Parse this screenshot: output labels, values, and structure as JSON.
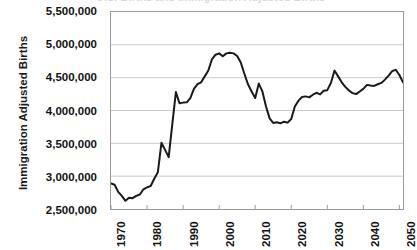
{
  "title_clipped": "U.S. Births and Immigration Adjusted Births",
  "axes": {
    "y_title": "Immigration Adjusted Births",
    "y_ticks": [
      "5,500,000",
      "5,000,000",
      "4,500,000",
      "4,000,000",
      "3,500,000",
      "3,000,000",
      "2,500,000"
    ],
    "x_ticks": [
      "1970",
      "1980",
      "1990",
      "2000",
      "2010",
      "2020",
      "2030",
      "2040",
      "2050"
    ]
  },
  "colors": {
    "series_line": "#1a1a1a",
    "gridline": "#c9c9c9",
    "frame": "#9a9a9a",
    "text": "#111111",
    "background": "#ffffff"
  },
  "chart_data": {
    "type": "line",
    "title": "",
    "xlabel": "",
    "ylabel": "Immigration Adjusted Births",
    "xlim": [
      1970,
      2051
    ],
    "ylim": [
      2500000,
      5500000
    ],
    "ytick_step": 500000,
    "xtick_step": 10,
    "grid": "horizontal",
    "legend": "none",
    "series": [
      {
        "name": "Immigration Adjusted Births",
        "color": "#1a1a1a",
        "x": [
          1970,
          1971,
          1972,
          1973,
          1974,
          1975,
          1976,
          1977,
          1978,
          1979,
          1980,
          1981,
          1982,
          1983,
          1984,
          1985,
          1986,
          1987,
          1988,
          1989,
          1990,
          1991,
          1992,
          1993,
          1994,
          1995,
          1996,
          1997,
          1998,
          1999,
          2000,
          2001,
          2002,
          2003,
          2004,
          2005,
          2006,
          2007,
          2008,
          2009,
          2010,
          2011,
          2012,
          2013,
          2014,
          2015,
          2016,
          2017,
          2018,
          2019,
          2020,
          2021,
          2022,
          2023,
          2024,
          2025,
          2026,
          2027,
          2028,
          2029,
          2030,
          2031,
          2032,
          2033,
          2034,
          2035,
          2036,
          2037,
          2038,
          2039,
          2040,
          2041,
          2042,
          2043,
          2044,
          2045,
          2046,
          2047,
          2048,
          2049,
          2050,
          2051
        ],
        "values": [
          2890000,
          2870000,
          2760000,
          2700000,
          2625000,
          2670000,
          2665000,
          2700000,
          2720000,
          2800000,
          2830000,
          2850000,
          2960000,
          3060000,
          3510000,
          3400000,
          3290000,
          3790000,
          4280000,
          4110000,
          4120000,
          4125000,
          4190000,
          4330000,
          4400000,
          4430000,
          4520000,
          4610000,
          4780000,
          4850000,
          4870000,
          4825000,
          4870000,
          4880000,
          4870000,
          4830000,
          4730000,
          4560000,
          4400000,
          4290000,
          4190000,
          4410000,
          4290000,
          4060000,
          3880000,
          3810000,
          3820000,
          3805000,
          3830000,
          3815000,
          3870000,
          4060000,
          4150000,
          4205000,
          4215000,
          4200000,
          4240000,
          4270000,
          4245000,
          4300000,
          4310000,
          4420000,
          4610000,
          4520000,
          4430000,
          4360000,
          4305000,
          4265000,
          4250000,
          4290000,
          4330000,
          4390000,
          4380000,
          4375000,
          4400000,
          4420000,
          4470000,
          4530000,
          4600000,
          4620000,
          4540000,
          4430000
        ]
      }
    ]
  }
}
